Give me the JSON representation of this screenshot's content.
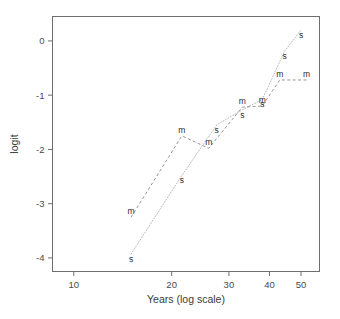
{
  "chart_data": {
    "type": "scatter",
    "title": "",
    "xlabel": "Years (log scale)",
    "ylabel": "logit",
    "xscale": "log",
    "xlim": [
      8.6,
      57
    ],
    "ylim": [
      -4.25,
      0.45
    ],
    "xticks": [
      10,
      20,
      30,
      40,
      50
    ],
    "xticklabels": [
      "10",
      "20",
      "30",
      "40",
      "50"
    ],
    "yticks": [
      0,
      -1,
      -2,
      -3,
      -4
    ],
    "yticklabels": [
      "0",
      "-1",
      "-2",
      "-3",
      "-4"
    ],
    "grid": false,
    "legend": "none",
    "point_marker_style": "text-letter",
    "series": [
      {
        "name": "m",
        "marker": "m",
        "linestyle": "dashed",
        "color": "#8a8a8a",
        "x": [
          15,
          21.5,
          26,
          33,
          38,
          43,
          52
        ],
        "y": [
          -3.25,
          -1.75,
          -1.98,
          -1.22,
          -1.2,
          -0.72,
          -0.72
        ]
      },
      {
        "name": "s",
        "marker": "s",
        "linestyle": "dotted",
        "color": "#b0b0b0",
        "x": [
          15,
          21.5,
          27.5,
          33,
          38,
          44.5,
          50
        ],
        "y": [
          -3.93,
          -2.48,
          -1.55,
          -1.27,
          -1.08,
          -0.19,
          0.2
        ]
      }
    ]
  },
  "axis": {
    "x_title": "Years (log scale)",
    "y_title": "logit"
  }
}
